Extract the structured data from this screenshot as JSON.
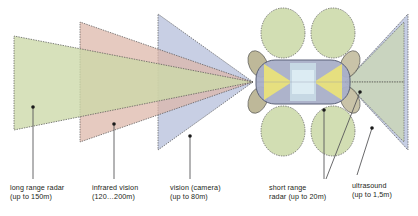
{
  "diagram": {
    "background_color": "#ffffff",
    "outline_color": "#4d4d4d"
  },
  "colors": {
    "long_range_radar": "#ccd9a8",
    "infrared_vision": "#ddb5a8",
    "vision_camera": "#b8c2dd",
    "short_range_radar": "#b8c2dd",
    "ultrasound": "#ccd9a8",
    "car_body": "#a9afc8",
    "car_roof": "#c6d8e4",
    "car_interior": "#e9e27a",
    "leader_line": "#58585a",
    "text": "#231f20"
  },
  "labels": [
    {
      "id": "long-range-radar",
      "name": "long range radar",
      "range": "(up to 150m)",
      "text": "long range radar\n(up to 150m)",
      "x": 10,
      "y": 183,
      "leader": {
        "x1": 33,
        "y1": 107,
        "x2": 33,
        "y2": 179,
        "dot": "top"
      }
    },
    {
      "id": "infrared-vision",
      "name": "infrared vision",
      "range": "(120…200m)",
      "text": "infrared vision\n(120…200m)",
      "x": 92,
      "y": 183,
      "leader": {
        "x1": 114,
        "y1": 124,
        "x2": 114,
        "y2": 179,
        "dot": "top"
      }
    },
    {
      "id": "vision-camera",
      "name": "vision (camera)",
      "range": "(up to 80m)",
      "text": "vision (camera)\n(up to 80m)",
      "x": 170,
      "y": 183,
      "leader": {
        "x1": 190,
        "y1": 136,
        "x2": 190,
        "y2": 179,
        "dot": "top"
      }
    },
    {
      "id": "short-range-radar",
      "name": "short range",
      "range": "radar (up to 20m)",
      "text": "short range\nradar (up to 20m)",
      "x": 269,
      "y": 183,
      "leader": {
        "x1": 324,
        "y1": 110,
        "x2": 324,
        "y2": 179,
        "dot": "top"
      }
    },
    {
      "id": "ultrasound",
      "name": "ultrasound",
      "range": "(up to 1,5m)",
      "text": "ultrasound\n(up to 1,5m)",
      "x": 352,
      "y": 181,
      "leader": {
        "x1": 372,
        "y1": 128,
        "x2": 357,
        "y2": 175,
        "dot": "top"
      }
    }
  ],
  "sensor_fields": [
    {
      "id": "long-range-radar-cone",
      "shape": "cone",
      "direction": "front",
      "color": "#ccd9a8",
      "reach_m": 150
    },
    {
      "id": "infrared-vision-cone",
      "shape": "cone",
      "direction": "front",
      "color": "#ddb5a8",
      "reach_m": 200
    },
    {
      "id": "vision-camera-cone",
      "shape": "cone",
      "direction": "front",
      "color": "#b8c2dd",
      "reach_m": 80
    },
    {
      "id": "short-range-radar-rear-cone",
      "shape": "cone",
      "direction": "rear",
      "color": "#b8c2dd",
      "reach_m": 20
    },
    {
      "id": "ultrasound-rear-cone",
      "shape": "cone",
      "direction": "rear",
      "color": "#ccd9a8",
      "reach_m": 1.5
    },
    {
      "id": "ultrasound-ellipse-front-left",
      "shape": "ellipse",
      "color": "#ccd9a8"
    },
    {
      "id": "ultrasound-ellipse-front-right",
      "shape": "ellipse",
      "color": "#ccd9a8"
    },
    {
      "id": "ultrasound-ellipse-rear-left",
      "shape": "ellipse",
      "color": "#ccd9a8"
    },
    {
      "id": "ultrasound-ellipse-rear-right",
      "shape": "ellipse",
      "color": "#ccd9a8"
    },
    {
      "id": "short-range-radar-corner-fl",
      "shape": "lobe",
      "color": "#c3bea0"
    },
    {
      "id": "short-range-radar-corner-fr",
      "shape": "lobe",
      "color": "#c3bea0"
    },
    {
      "id": "short-range-radar-corner-rl",
      "shape": "lobe",
      "color": "#c3bea0"
    },
    {
      "id": "short-range-radar-corner-rr",
      "shape": "lobe",
      "color": "#c3bea0"
    }
  ]
}
